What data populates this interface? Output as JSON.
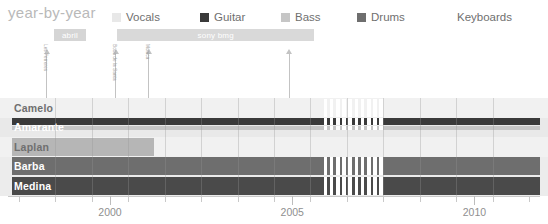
{
  "header": {
    "title": "year-by-year",
    "title_color": "#b9b9b9"
  },
  "legend": {
    "items": [
      {
        "label": "Vocals",
        "color": "#e8e8e8",
        "pattern": "solid"
      },
      {
        "label": "Guitar",
        "color": "#3a3a3a",
        "pattern": "solid"
      },
      {
        "label": "Bass",
        "color": "#c6c6c6",
        "pattern": "solid"
      },
      {
        "label": "Drums",
        "color": "#6e6e6e",
        "pattern": "solid"
      },
      {
        "label": "Keyboards",
        "color": "#4a4a4a",
        "pattern": "striped"
      }
    ]
  },
  "periods": [
    {
      "label": "abril",
      "start_year": 1998.45,
      "end_year": 1999.35,
      "color": "#d5d5d5"
    },
    {
      "label": "sony bmg",
      "start_year": 2000.2,
      "end_year": 2005.6,
      "color": "#d9d9d9"
    }
  ],
  "markers": [
    {
      "label": "Les Ferreres",
      "year": 1998.25
    },
    {
      "label": "Boca de la Santa",
      "year": 2000.15
    },
    {
      "label": "Monica",
      "year": 2001.05
    },
    {
      "label": "",
      "year": 2004.9
    }
  ],
  "rows": [
    {
      "name": "Camelo",
      "label_color": "#6f6f6f",
      "band_color": "#f1f1f1"
    },
    {
      "name": "Amarante",
      "label_color": "#ffffff",
      "band_color": "#e9e9e9"
    },
    {
      "name": "Laplan",
      "label_color": "#6f6f6f",
      "band_color": "#f1f1f1"
    },
    {
      "name": "Barba",
      "label_color": "#ffffff",
      "band_color": "#ececec"
    },
    {
      "name": "Medina",
      "label_color": "#ffffff",
      "band_color": "#ececec"
    }
  ],
  "axis": {
    "labels": [
      {
        "text": "2000",
        "year": 2000
      },
      {
        "text": "2005",
        "year": 2005
      },
      {
        "text": "2010",
        "year": 2010
      }
    ],
    "tick_years": [
      1997.5,
      1998.5,
      1999.5,
      2000,
      2000.5,
      2001.5,
      2002.5,
      2003.5,
      2004.5,
      2005,
      2005.5,
      2006.5,
      2007.5,
      2008.5,
      2009.5,
      2010,
      2010.5,
      2011.5
    ],
    "label_color": "#8f8f8f"
  },
  "chart_data": {
    "type": "bar",
    "title": "year-by-year",
    "xlabel": "",
    "ylabel": "",
    "orientation": "horizontal",
    "grid": true,
    "legend_position": "top",
    "xlim": [
      1997.2,
      2011.8
    ],
    "categories": [
      "Camelo",
      "Amarante",
      "Laplan",
      "Barba",
      "Medina"
    ],
    "series": [
      {
        "name": "Vocals",
        "color": "#e8e8e8"
      },
      {
        "name": "Guitar",
        "color": "#3a3a3a"
      },
      {
        "name": "Bass",
        "color": "#c6c6c6"
      },
      {
        "name": "Drums",
        "color": "#6e6e6e"
      },
      {
        "name": "Keyboards",
        "color": "#4a4a4a"
      }
    ],
    "bars": [
      {
        "row": "Camelo",
        "series": "Vocals",
        "color": "#f1f1f1",
        "pattern": "solid",
        "segments": [
          [
            1997.3,
            2005.8
          ],
          [
            2007.55,
            2011.8
          ]
        ],
        "track": 0,
        "thickness": 18
      },
      {
        "row": "Amarante",
        "series": "Guitar",
        "color": "#3a3a3a",
        "pattern": "solid",
        "segments": [
          [
            1997.3,
            2005.8
          ],
          [
            2007.55,
            2011.8
          ]
        ],
        "track": 0,
        "thickness": 7
      },
      {
        "row": "Amarante",
        "series": "Bass",
        "color": "#c6c6c6",
        "pattern": "solid",
        "segments": [
          [
            1997.3,
            2005.8
          ],
          [
            2007.55,
            2011.8
          ]
        ],
        "track": 1,
        "thickness": 4
      },
      {
        "row": "Laplan",
        "series": "Bass",
        "color": "#b6b6b6",
        "pattern": "solid",
        "segments": [
          [
            1997.3,
            2001.2
          ]
        ],
        "track": 0,
        "thickness": 18
      },
      {
        "row": "Barba",
        "series": "Drums",
        "color": "#6e6e6e",
        "pattern": "solid",
        "segments": [
          [
            1997.3,
            2005.8
          ],
          [
            2007.55,
            2011.8
          ]
        ],
        "track": 0,
        "thickness": 18
      },
      {
        "row": "Medina",
        "series": "Keyboards",
        "color": "#4a4a4a",
        "pattern": "striped",
        "segments": [
          [
            1997.3,
            2005.8
          ],
          [
            2007.55,
            2011.8
          ]
        ],
        "track": 0,
        "thickness": 18
      }
    ],
    "gap_band": {
      "start_year": 2005.8,
      "end_year": 2007.55,
      "style": "hatched"
    },
    "annotations": [
      {
        "text": "abril",
        "type": "period",
        "start_year": 1998.45,
        "end_year": 1999.35
      },
      {
        "text": "sony bmg",
        "type": "period",
        "start_year": 2000.2,
        "end_year": 2005.6
      },
      {
        "text": "Les Ferreres",
        "type": "event",
        "year": 1998.25
      },
      {
        "text": "Boca de la Santa",
        "type": "event",
        "year": 2000.15
      },
      {
        "text": "Monica",
        "type": "event",
        "year": 2001.05
      },
      {
        "text": "",
        "type": "event",
        "year": 2004.9
      }
    ]
  }
}
